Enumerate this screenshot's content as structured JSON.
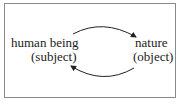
{
  "diagram": {
    "left_node": {
      "label": "human being",
      "role": "(subject)"
    },
    "right_node": {
      "label": "nature",
      "role": "(object)"
    },
    "edges": [
      {
        "from": "human being",
        "to": "nature",
        "direction": "top arc, left to right"
      },
      {
        "from": "nature",
        "to": "human being",
        "direction": "bottom arc, right to left"
      }
    ],
    "colors": {
      "border": "#8a8a8a",
      "text": "#222222",
      "arrow": "#222222"
    }
  }
}
